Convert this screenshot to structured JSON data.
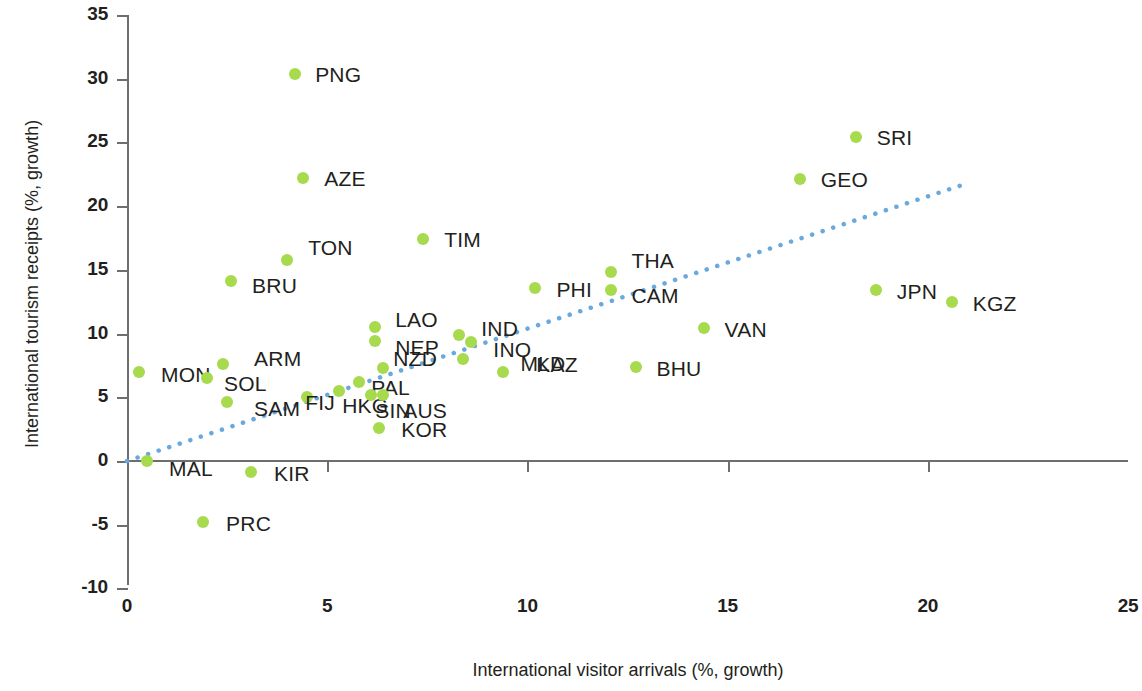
{
  "chart_data": {
    "type": "scatter",
    "title": "",
    "xlabel": "International visitor arrivals (%, growth)",
    "ylabel": "International tourism receipts (%, growth)",
    "xlim": [
      0,
      25
    ],
    "ylim": [
      -10,
      35
    ],
    "xticks": [
      "0",
      "5",
      "10",
      "15",
      "20",
      "25"
    ],
    "yticks": [
      "35",
      "30",
      "25",
      "20",
      "15",
      "10",
      "5",
      "0",
      "-5",
      "-10"
    ],
    "grid": false,
    "legend": null,
    "marker_color": "#a7da4d",
    "trendline": {
      "style": "dotted",
      "color": "#6aa9dd",
      "x_start": 0.0,
      "y_start": 0.0,
      "x_end": 20.8,
      "y_end": 21.6
    },
    "points": [
      {
        "label": "PNG",
        "x": 4.2,
        "y": 30.4,
        "lx": 20,
        "ly": -11
      },
      {
        "label": "SRI",
        "x": 18.2,
        "y": 25.4,
        "lx": 21,
        "ly": -11
      },
      {
        "label": "GEO",
        "x": 16.8,
        "y": 22.1,
        "lx": 21,
        "ly": -11
      },
      {
        "label": "AZE",
        "x": 4.4,
        "y": 22.2,
        "lx": 21,
        "ly": -11
      },
      {
        "label": "TIM",
        "x": 7.4,
        "y": 17.4,
        "lx": 21,
        "ly": -11
      },
      {
        "label": "TON",
        "x": 4.0,
        "y": 15.8,
        "lx": 21,
        "ly": -24
      },
      {
        "label": "BRU",
        "x": 2.6,
        "y": 14.1,
        "lx": 21,
        "ly": -7
      },
      {
        "label": "THA",
        "x": 12.1,
        "y": 14.8,
        "lx": 20,
        "ly": -23
      },
      {
        "label": "CAM",
        "x": 12.1,
        "y": 13.4,
        "lx": 20,
        "ly": -6
      },
      {
        "label": "PHI",
        "x": 10.2,
        "y": 13.6,
        "lx": 21,
        "ly": -10
      },
      {
        "label": "JPN",
        "x": 18.7,
        "y": 13.4,
        "lx": 21,
        "ly": -10
      },
      {
        "label": "KGZ",
        "x": 20.6,
        "y": 12.5,
        "lx": 21,
        "ly": -10
      },
      {
        "label": "LAO",
        "x": 6.2,
        "y": 10.5,
        "lx": 20,
        "ly": -19
      },
      {
        "label": "NEP",
        "x": 6.2,
        "y": 9.4,
        "lx": 20,
        "ly": -5
      },
      {
        "label": "IND",
        "x": 8.3,
        "y": 9.9,
        "lx": 22,
        "ly": -18
      },
      {
        "label": "INO",
        "x": 8.6,
        "y": 9.3,
        "lx": 22,
        "ly": -4
      },
      {
        "label": "VAN",
        "x": 14.4,
        "y": 10.4,
        "lx": 21,
        "ly": -10
      },
      {
        "label": "MON",
        "x": 0.3,
        "y": 7.0,
        "lx": 22,
        "ly": -9
      },
      {
        "label": "ARM",
        "x": 2.4,
        "y": 7.6,
        "lx": 31,
        "ly": -17
      },
      {
        "label": "SOL",
        "x": 2.0,
        "y": 6.5,
        "lx": 17,
        "ly": -6
      },
      {
        "label": "SAM",
        "x": 2.5,
        "y": 4.6,
        "lx": 27,
        "ly": -5
      },
      {
        "label": "BHU",
        "x": 12.7,
        "y": 7.4,
        "lx": 21,
        "ly": -10
      },
      {
        "label": "MLD",
        "x": 9.4,
        "y": 7.0,
        "lx": 17,
        "ly": -20
      },
      {
        "label": "KAZ",
        "x": 8.4,
        "y": 8.0,
        "lx": 73,
        "ly": -6
      },
      {
        "label": "NZD",
        "x": 6.4,
        "y": 7.3,
        "lx": 10,
        "ly": -21
      },
      {
        "label": "PAL",
        "x": 5.8,
        "y": 6.2,
        "lx": 12,
        "ly": -6
      },
      {
        "label": "FIJ",
        "x": 4.5,
        "y": 5.0,
        "lx": -2,
        "ly": -6
      },
      {
        "label": "HKG",
        "x": 5.3,
        "y": 5.5,
        "lx": 3,
        "ly": 3
      },
      {
        "label": "SIN",
        "x": 6.1,
        "y": 5.2,
        "lx": 4,
        "ly": 4
      },
      {
        "label": "AUS",
        "x": 6.4,
        "y": 5.2,
        "lx": 20,
        "ly": 4
      },
      {
        "label": "KOR",
        "x": 6.3,
        "y": 2.6,
        "lx": 22,
        "ly": -10
      },
      {
        "label": "MAL",
        "x": 0.5,
        "y": 0.0,
        "lx": 22,
        "ly": -4
      },
      {
        "label": "KIR",
        "x": 3.1,
        "y": -0.9,
        "lx": 23,
        "ly": -10
      },
      {
        "label": "PRC",
        "x": 1.9,
        "y": -4.8,
        "lx": 23,
        "ly": -10
      }
    ]
  }
}
